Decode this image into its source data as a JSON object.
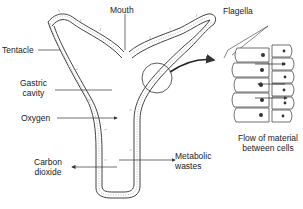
{
  "labels": {
    "mouth": "Mouth",
    "tentacle": "Tentacle",
    "gastric_cavity_line1": "Gastric",
    "gastric_cavity_line2": "cavity",
    "oxygen": "Oxygen",
    "carbon_dioxide_line1": "Carbon",
    "carbon_dioxide_line2": "dioxide",
    "metabolic_wastes_line1": "Metabolic",
    "metabolic_wastes_line2": "wastes",
    "flagella": "Flagella",
    "flow_line1": "Flow of material",
    "flow_line2": "between cells"
  },
  "colors": {
    "line": "#333333",
    "background": "#ffffff"
  }
}
